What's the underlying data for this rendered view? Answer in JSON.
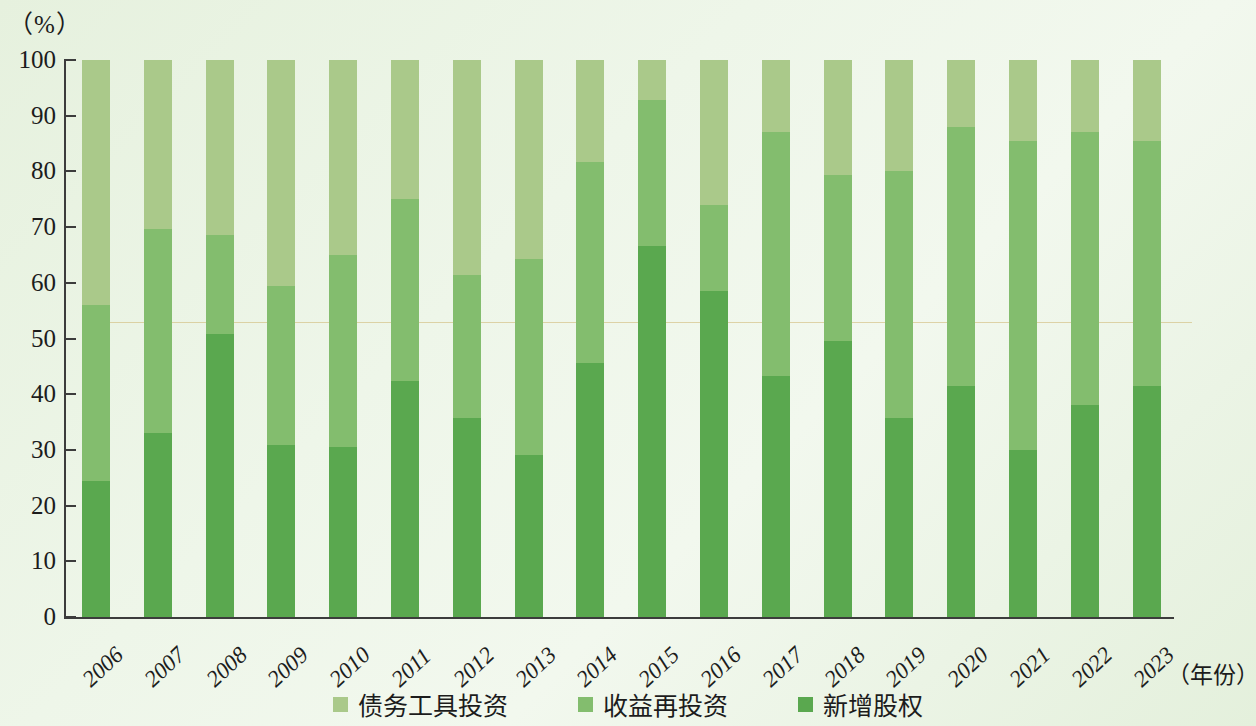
{
  "axis": {
    "y_unit_label": "（%）",
    "x_unit_label": "（年份）",
    "y_ticks": [
      0,
      10,
      20,
      30,
      40,
      50,
      60,
      70,
      80,
      90,
      100
    ]
  },
  "legend": {
    "items": [
      {
        "label": "债务工具投资",
        "color": "#aac98a",
        "key": "debt_instrument_investment"
      },
      {
        "label": "收益再投资",
        "color": "#83bd6e",
        "key": "reinvested_earnings"
      },
      {
        "label": "新增股权",
        "color": "#5aa84f",
        "key": "new_equity"
      }
    ]
  },
  "colors": {
    "light": "#aac98a",
    "mid": "#83bd6e",
    "dark": "#5aa84f",
    "background": "#eaf3e4",
    "axis": "#3c3c3c"
  },
  "chart_data": {
    "type": "bar",
    "title": "",
    "subtitle": "",
    "stacked": true,
    "stack_total": 100,
    "xlabel": "（年份）",
    "ylabel": "（%）",
    "ylim": [
      0,
      100
    ],
    "ytick_step": 10,
    "grid": false,
    "legend_position": "bottom-center",
    "categories": [
      "2006",
      "2007",
      "2008",
      "2009",
      "2010",
      "2011",
      "2012",
      "2013",
      "2014",
      "2015",
      "2016",
      "2017",
      "2018",
      "2019",
      "2020",
      "2021",
      "2022",
      "2023"
    ],
    "series": [
      {
        "name": "新增股权",
        "color": "#5aa84f",
        "values": [
          24.5,
          33.0,
          50.8,
          30.9,
          30.5,
          42.3,
          35.8,
          29.0,
          45.6,
          66.6,
          58.5,
          43.2,
          49.5,
          35.7,
          41.5,
          30.0,
          38.0,
          41.4
        ]
      },
      {
        "name": "收益再投资",
        "color": "#83bd6e",
        "values": [
          31.5,
          36.7,
          17.8,
          28.5,
          34.5,
          32.7,
          25.6,
          35.2,
          36.1,
          26.2,
          15.5,
          43.8,
          29.8,
          44.3,
          46.5,
          55.5,
          49.0,
          44.1
        ]
      },
      {
        "name": "债务工具投资",
        "color": "#aac98a",
        "values": [
          44.0,
          30.3,
          31.4,
          40.6,
          35.0,
          25.0,
          38.6,
          35.8,
          18.3,
          7.2,
          26.0,
          13.0,
          20.7,
          20.0,
          12.0,
          14.5,
          13.0,
          14.5
        ]
      }
    ],
    "cumulative_tops": {
      "new_equity": [
        24.5,
        33.0,
        50.8,
        30.9,
        30.5,
        42.3,
        35.8,
        29.0,
        45.6,
        66.6,
        58.5,
        43.2,
        49.5,
        35.7,
        41.5,
        30.0,
        38.0,
        41.4
      ],
      "plus_reinvested": [
        56.0,
        69.7,
        68.6,
        59.4,
        65.0,
        75.0,
        61.4,
        64.2,
        81.7,
        92.8,
        74.0,
        87.0,
        79.3,
        80.0,
        88.0,
        85.5,
        87.0,
        85.5
      ],
      "total": [
        100,
        100,
        100,
        100,
        100,
        100,
        100,
        100,
        100,
        100,
        100,
        100,
        100,
        100,
        100,
        100,
        100,
        100
      ]
    }
  }
}
